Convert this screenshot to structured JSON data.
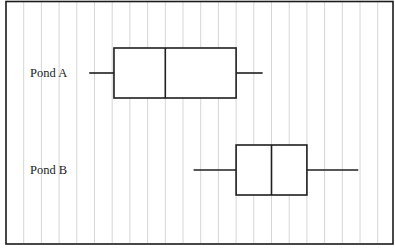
{
  "chart_data": {
    "type": "box",
    "title": "",
    "xlabel": "",
    "ylabel": "",
    "axis_ticks_shown": false,
    "grid": {
      "vertical": true,
      "horizontal": false,
      "unit_spacing_note": "values expressed in grid units; left frame edge = 0, each vertical gridline = +1",
      "xlim": [
        0,
        21
      ]
    },
    "legend": null,
    "categories": [
      "Pond A",
      "Pond B"
    ],
    "series": [
      {
        "name": "Pond A",
        "min": 4.7,
        "q1": 6.1,
        "median": 9.0,
        "q3": 13.0,
        "max": 14.5
      },
      {
        "name": "Pond B",
        "min": 10.6,
        "q1": 13.0,
        "median": 15.0,
        "q3": 17.0,
        "max": 19.9
      }
    ]
  },
  "labels": {
    "pond_a": "Pond A",
    "pond_b": "Pond B"
  },
  "colors": {
    "stroke": "#1f1f1f",
    "grid": "#d6d6d6",
    "background": "#ffffff"
  }
}
